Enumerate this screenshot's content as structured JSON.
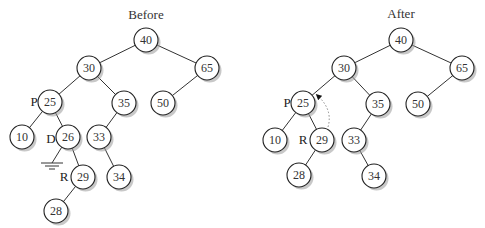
{
  "panels": [
    {
      "id": "before",
      "title": "Before",
      "title_pos": [
        146,
        19
      ],
      "nodes": [
        {
          "id": "b40",
          "value": "40",
          "x": 146,
          "y": 40
        },
        {
          "id": "b30",
          "value": "30",
          "x": 89,
          "y": 68
        },
        {
          "id": "b65",
          "value": "65",
          "x": 207,
          "y": 68
        },
        {
          "id": "b25",
          "value": "25",
          "x": 50,
          "y": 102
        },
        {
          "id": "b35",
          "value": "35",
          "x": 124,
          "y": 103
        },
        {
          "id": "b50",
          "value": "50",
          "x": 163,
          "y": 103
        },
        {
          "id": "b10",
          "value": "10",
          "x": 22,
          "y": 137
        },
        {
          "id": "b26",
          "value": "26",
          "x": 68,
          "y": 137
        },
        {
          "id": "b33",
          "value": "33",
          "x": 99,
          "y": 137
        },
        {
          "id": "b29",
          "value": "29",
          "x": 83,
          "y": 177
        },
        {
          "id": "b34",
          "value": "34",
          "x": 119,
          "y": 177
        },
        {
          "id": "b28",
          "value": "28",
          "x": 56,
          "y": 211
        }
      ],
      "edges": [
        [
          "b40",
          "b30"
        ],
        [
          "b40",
          "b65"
        ],
        [
          "b30",
          "b25"
        ],
        [
          "b30",
          "b35"
        ],
        [
          "b65",
          "b50"
        ],
        [
          "b25",
          "b10"
        ],
        [
          "b25",
          "b26"
        ],
        [
          "b35",
          "b33"
        ],
        [
          "b26",
          "b29"
        ],
        [
          "b33",
          "b34"
        ],
        [
          "b29",
          "b28"
        ]
      ],
      "labels": [
        {
          "text": "P",
          "x": 34,
          "y": 106
        },
        {
          "text": "D",
          "x": 51,
          "y": 143
        },
        {
          "text": "R",
          "x": 64,
          "y": 181
        }
      ],
      "null_link": {
        "from": "b26",
        "to_x": 52,
        "to_y": 163
      }
    },
    {
      "id": "after",
      "title": "After",
      "title_pos": [
        401,
        18
      ],
      "nodes": [
        {
          "id": "a40",
          "value": "40",
          "x": 401,
          "y": 40
        },
        {
          "id": "a30",
          "value": "30",
          "x": 344,
          "y": 68
        },
        {
          "id": "a65",
          "value": "65",
          "x": 462,
          "y": 68
        },
        {
          "id": "a25",
          "value": "25",
          "x": 303,
          "y": 103
        },
        {
          "id": "a35",
          "value": "35",
          "x": 378,
          "y": 104
        },
        {
          "id": "a50",
          "value": "50",
          "x": 418,
          "y": 104
        },
        {
          "id": "a10",
          "value": "10",
          "x": 275,
          "y": 140
        },
        {
          "id": "a29",
          "value": "29",
          "x": 322,
          "y": 140
        },
        {
          "id": "a33",
          "value": "33",
          "x": 354,
          "y": 140
        },
        {
          "id": "a28",
          "value": "28",
          "x": 299,
          "y": 175
        },
        {
          "id": "a34",
          "value": "34",
          "x": 374,
          "y": 176
        }
      ],
      "edges": [
        [
          "a40",
          "a30"
        ],
        [
          "a40",
          "a65"
        ],
        [
          "a30",
          "a25"
        ],
        [
          "a30",
          "a35"
        ],
        [
          "a65",
          "a50"
        ],
        [
          "a25",
          "a10"
        ],
        [
          "a25",
          "a29"
        ],
        [
          "a35",
          "a33"
        ],
        [
          "a29",
          "a28"
        ],
        [
          "a33",
          "a34"
        ]
      ],
      "labels": [
        {
          "text": "P",
          "x": 287,
          "y": 107
        },
        {
          "text": "R",
          "x": 303,
          "y": 144
        }
      ],
      "dotted_arrow": {
        "from_x": 328,
        "from_y": 127,
        "ctrl_x": 333,
        "ctrl_y": 110,
        "to_x": 318,
        "to_y": 96
      }
    }
  ],
  "node_radius": 12,
  "colors": {
    "stroke": "#222222",
    "shadow": "#9a9a9a",
    "text": "#333333",
    "arrow": "#888888"
  }
}
